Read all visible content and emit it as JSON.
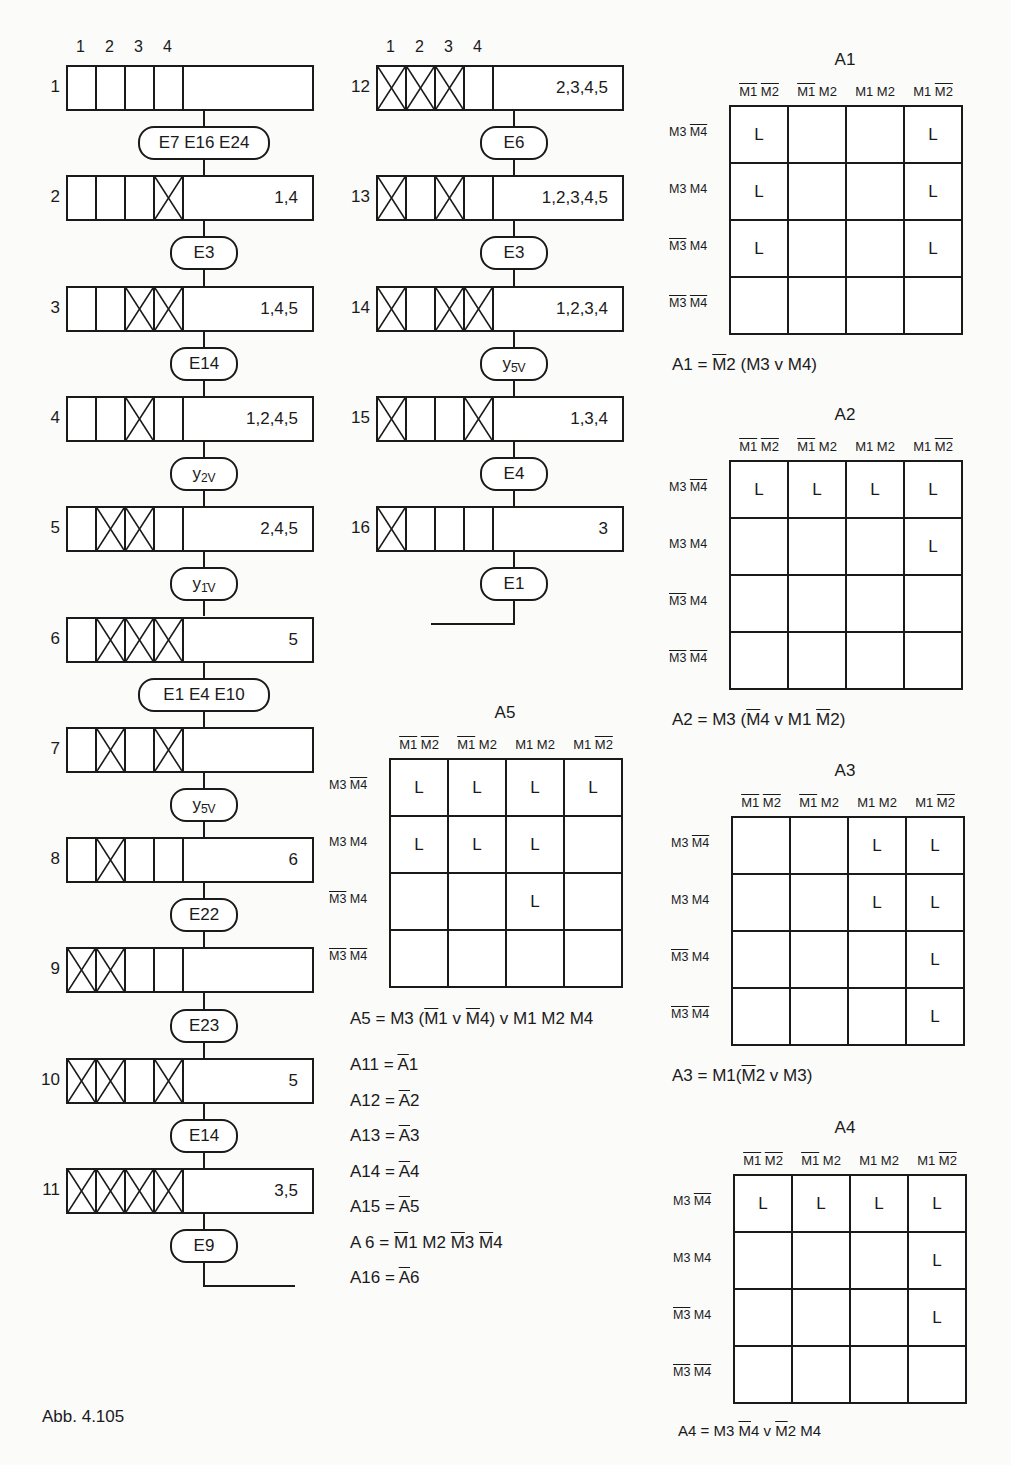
{
  "caption": "Abb. 4.105",
  "column_headers": [
    "1",
    "2",
    "3",
    "4"
  ],
  "flow_left": {
    "steps": [
      {
        "num": "1",
        "cells": [
          0,
          0,
          0,
          0
        ],
        "value": ""
      },
      {
        "num": "2",
        "cells": [
          0,
          0,
          0,
          1
        ],
        "value": "1,4"
      },
      {
        "num": "3",
        "cells": [
          0,
          0,
          1,
          1
        ],
        "value": "1,4,5"
      },
      {
        "num": "4",
        "cells": [
          0,
          0,
          1,
          0
        ],
        "value": "1,2,4,5"
      },
      {
        "num": "5",
        "cells": [
          0,
          1,
          1,
          0
        ],
        "value": "2,4,5"
      },
      {
        "num": "6",
        "cells": [
          0,
          1,
          1,
          1
        ],
        "value": "5"
      },
      {
        "num": "7",
        "cells": [
          0,
          1,
          0,
          1
        ],
        "value": ""
      },
      {
        "num": "8",
        "cells": [
          0,
          1,
          0,
          0
        ],
        "value": "6"
      },
      {
        "num": "9",
        "cells": [
          1,
          1,
          0,
          0
        ],
        "value": ""
      },
      {
        "num": "10",
        "cells": [
          1,
          1,
          0,
          1
        ],
        "value": "5"
      },
      {
        "num": "11",
        "cells": [
          1,
          1,
          1,
          1
        ],
        "value": "3,5"
      }
    ],
    "conditions": [
      {
        "label": "E7 E16 E24"
      },
      {
        "label": "E3"
      },
      {
        "label": "E14"
      },
      {
        "label": "y",
        "sub": "2V"
      },
      {
        "label": "y",
        "sub": "1̄V"
      },
      {
        "label": "E1 E4 E10"
      },
      {
        "label": "y",
        "sub": "5̄V"
      },
      {
        "label": "E22"
      },
      {
        "label": "E23"
      },
      {
        "label": "E14"
      },
      {
        "label": "E9"
      }
    ]
  },
  "flow_right": {
    "steps": [
      {
        "num": "12",
        "cells": [
          1,
          1,
          1,
          0
        ],
        "value": "2,3,4,5"
      },
      {
        "num": "13",
        "cells": [
          1,
          0,
          1,
          0
        ],
        "value": "1,2,3,4,5"
      },
      {
        "num": "14",
        "cells": [
          1,
          0,
          1,
          1
        ],
        "value": "1,2,3,4"
      },
      {
        "num": "15",
        "cells": [
          1,
          0,
          0,
          1
        ],
        "value": "1,3,4"
      },
      {
        "num": "16",
        "cells": [
          1,
          0,
          0,
          0
        ],
        "value": "3"
      }
    ],
    "conditions": [
      {
        "label": "E6"
      },
      {
        "label": "E3"
      },
      {
        "label": "y",
        "sub": "5̄V"
      },
      {
        "label": "E4"
      },
      {
        "label": "E1"
      }
    ]
  },
  "kmaps": {
    "col_headers": [
      [
        {
          "t": "M1",
          "o": true
        },
        {
          "t": " "
        },
        {
          "t": "M2",
          "o": true
        }
      ],
      [
        {
          "t": "M1",
          "o": true
        },
        {
          "t": " M2"
        }
      ],
      [
        {
          "t": "M1 M2"
        }
      ],
      [
        {
          "t": "M1 "
        },
        {
          "t": "M2",
          "o": true
        }
      ]
    ],
    "row_headers": [
      [
        {
          "t": "M3 "
        },
        {
          "t": "M4",
          "o": true
        }
      ],
      [
        {
          "t": "M3 M4"
        }
      ],
      [
        {
          "t": "M3",
          "o": true
        },
        {
          "t": " M4"
        }
      ],
      [
        {
          "t": "M3",
          "o": true
        },
        {
          "t": " "
        },
        {
          "t": "M4",
          "o": true
        }
      ]
    ],
    "maps": [
      {
        "id": "A1",
        "title": "A1",
        "cells": [
          [
            "L",
            "",
            "",
            "L"
          ],
          [
            "L",
            "",
            "",
            "L"
          ],
          [
            "L",
            "",
            "",
            "L"
          ],
          [
            "",
            "",
            "",
            ""
          ]
        ],
        "formula": [
          {
            "t": "A1 = "
          },
          {
            "t": "M",
            "o": true
          },
          {
            "t": "2 (M3 v M4)"
          }
        ]
      },
      {
        "id": "A2",
        "title": "A2",
        "cells": [
          [
            "L",
            "L",
            "L",
            "L"
          ],
          [
            "",
            "",
            "",
            "L"
          ],
          [
            "",
            "",
            "",
            ""
          ],
          [
            "",
            "",
            "",
            ""
          ]
        ],
        "formula": [
          {
            "t": "A2 = M3 ("
          },
          {
            "t": "M",
            "o": true
          },
          {
            "t": "4 v M1 "
          },
          {
            "t": "M",
            "o": true
          },
          {
            "t": "2)"
          }
        ]
      },
      {
        "id": "A3",
        "title": "A3",
        "cells": [
          [
            "",
            "",
            "L",
            "L"
          ],
          [
            "",
            "",
            "L",
            "L"
          ],
          [
            "",
            "",
            "",
            "L"
          ],
          [
            "",
            "",
            "",
            "L"
          ]
        ],
        "formula": [
          {
            "t": "A3 = M1("
          },
          {
            "t": "M",
            "o": true
          },
          {
            "t": "2 v M3)"
          }
        ]
      },
      {
        "id": "A4",
        "title": "A4",
        "cells": [
          [
            "L",
            "L",
            "L",
            "L"
          ],
          [
            "",
            "",
            "",
            "L"
          ],
          [
            "",
            "",
            "",
            "L"
          ],
          [
            "",
            "",
            "",
            ""
          ]
        ],
        "formula": [
          {
            "t": "A4 = M3 "
          },
          {
            "t": "M",
            "o": true
          },
          {
            "t": "4 v "
          },
          {
            "t": "M",
            "o": true
          },
          {
            "t": "2 M4"
          }
        ]
      },
      {
        "id": "A5",
        "title": "A5",
        "cells": [
          [
            "L",
            "L",
            "L",
            "L"
          ],
          [
            "L",
            "L",
            "L",
            ""
          ],
          [
            "",
            "",
            "L",
            ""
          ],
          [
            "",
            "",
            "",
            ""
          ]
        ],
        "formula": [
          {
            "t": "A5 = M3 ("
          },
          {
            "t": "M",
            "o": true
          },
          {
            "t": "1 v "
          },
          {
            "t": "M",
            "o": true
          },
          {
            "t": "4) v M1 M2 M4"
          }
        ]
      }
    ]
  },
  "equations": [
    [
      {
        "t": "A11 = "
      },
      {
        "t": "A",
        "o": true
      },
      {
        "t": "1"
      }
    ],
    [
      {
        "t": "A12 = "
      },
      {
        "t": "A",
        "o": true
      },
      {
        "t": "2"
      }
    ],
    [
      {
        "t": "A13 = "
      },
      {
        "t": "A",
        "o": true
      },
      {
        "t": "3"
      }
    ],
    [
      {
        "t": "A14 = "
      },
      {
        "t": "A",
        "o": true
      },
      {
        "t": "4"
      }
    ],
    [
      {
        "t": "A15 = "
      },
      {
        "t": "A",
        "o": true
      },
      {
        "t": "5"
      }
    ],
    [
      {
        "t": "A  6 = "
      },
      {
        "t": "M",
        "o": true
      },
      {
        "t": "1 M2 "
      },
      {
        "t": "M",
        "o": true
      },
      {
        "t": "3 "
      },
      {
        "t": "M",
        "o": true
      },
      {
        "t": "4"
      }
    ],
    [
      {
        "t": "A16 = "
      },
      {
        "t": "A",
        "o": true
      },
      {
        "t": "6"
      }
    ]
  ]
}
